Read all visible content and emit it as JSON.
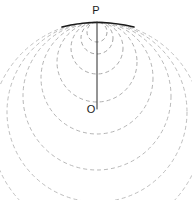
{
  "figure": {
    "canvas": {
      "width": 192,
      "height": 200,
      "background": "#ffffff"
    },
    "labels": [
      {
        "id": "P",
        "text": "P",
        "x": 96,
        "y": 14,
        "anchor": "middle",
        "role": "tangency-point-label"
      },
      {
        "id": "O",
        "text": "O",
        "x": 91,
        "y": 113,
        "anchor": "middle",
        "role": "center-point-label"
      }
    ],
    "points": [
      {
        "id": "P",
        "x": 97,
        "y": 22,
        "role": "common-tangency-point"
      },
      {
        "id": "O",
        "x": 97,
        "y": 108,
        "role": "marked-center",
        "marker": "open-circle",
        "radius": 3.5
      }
    ],
    "axis_line": {
      "name": "vertical-diameter",
      "x1": 97,
      "y1": 22,
      "x2": 97,
      "y2": 109,
      "color": "#2a2a2a",
      "width": 1
    },
    "tangent_arc": {
      "name": "tangent-line-at-P",
      "description": "solid dark arc through P, tangent to all circles",
      "color": "#1a1a1a",
      "width": 1.6,
      "path": "M 62 27 Q 97 18 134 27"
    },
    "circles": [
      {
        "index": 1,
        "cx": 97,
        "cy": 32,
        "r": 10,
        "color": "#9a9a9a"
      },
      {
        "index": 2,
        "cx": 97,
        "cy": 38,
        "r": 16,
        "color": "#9a9a9a"
      },
      {
        "index": 3,
        "cx": 97,
        "cy": 48,
        "r": 26,
        "color": "#a0a0a0"
      },
      {
        "index": 4,
        "cx": 97,
        "cy": 62,
        "r": 40,
        "color": "#a6a6a6"
      },
      {
        "index": 5,
        "cx": 97,
        "cy": 78,
        "r": 56,
        "color": "#ababab"
      },
      {
        "index": 6,
        "cx": 97,
        "cy": 96,
        "r": 74,
        "color": "#b0b0b0"
      },
      {
        "index": 7,
        "cx": 97,
        "cy": 112,
        "r": 90,
        "color": "#b5b5b5"
      },
      {
        "index": 8,
        "cx": 97,
        "cy": 128,
        "r": 106,
        "color": "#bababa"
      }
    ],
    "style": {
      "dash_pattern": "4 3",
      "stroke_width": 0.9,
      "line_color": "#2a2a2a",
      "dashed_color": "#a8a8a8"
    }
  }
}
